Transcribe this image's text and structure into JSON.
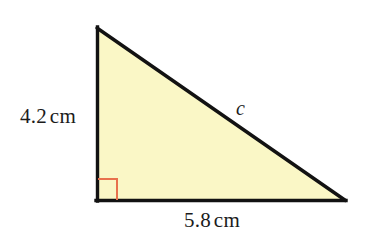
{
  "figure": {
    "type": "right-triangle-diagram",
    "background_color": "#ffffff",
    "fill_color": "#faf7c6",
    "stroke_color": "#121212",
    "right_angle_color": "#e8714d",
    "vertices": {
      "apex": [
        97,
        28
      ],
      "bottom_left": [
        97,
        200
      ],
      "bottom_right": [
        345,
        200
      ]
    },
    "labels": {
      "vertical_side_value": "4.2",
      "vertical_side_unit": "cm",
      "horizontal_side_value": "5.8",
      "horizontal_side_unit": "cm",
      "hypotenuse": "c"
    },
    "right_angle_marker": {
      "x": 98,
      "y": 178,
      "size": 20
    }
  }
}
